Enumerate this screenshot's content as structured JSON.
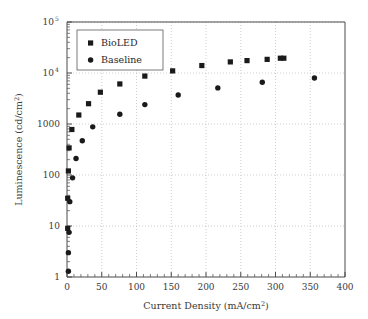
{
  "chart_data": {
    "type": "scatter",
    "title": "",
    "xlabel": "Current Density (mA/cm2)",
    "xlabel_base": "Current Density (mA/cm",
    "xlabel_sup": "2",
    "xlabel_tail": ")",
    "ylabel": "Luminescence (cd/cm2)",
    "ylabel_base": "Luminescence (cd/cm",
    "ylabel_sup": "2",
    "ylabel_tail": ")",
    "xlim": [
      0,
      400
    ],
    "ylim": [
      1,
      100000
    ],
    "yscale": "log",
    "xscale": "linear",
    "grid": true,
    "legend_position": "top-left",
    "xticks": [
      0,
      50,
      100,
      150,
      200,
      250,
      300,
      350,
      400
    ],
    "xtick_labels": [
      "0",
      "50",
      "100",
      "150",
      "200",
      "250",
      "300",
      "350",
      "400"
    ],
    "x_minor_step": 10,
    "yticks": [
      1,
      10,
      100,
      1000,
      10000,
      100000
    ],
    "ytick_labels": [
      "1",
      "10",
      "100",
      "1000",
      "10",
      "10"
    ],
    "ytick_label_sup": [
      "",
      "",
      "",
      "",
      "4",
      "5"
    ],
    "series": [
      {
        "name": "BioLED",
        "marker": "square",
        "color": "#1a1a1a",
        "points": [
          [
            1,
            35
          ],
          [
            1,
            9
          ],
          [
            2,
            120
          ],
          [
            3,
            340
          ],
          [
            7,
            780
          ],
          [
            17,
            1500
          ],
          [
            31,
            2500
          ],
          [
            48,
            4200
          ],
          [
            76,
            6100
          ],
          [
            112,
            8700
          ],
          [
            152,
            11000
          ],
          [
            194,
            14000
          ],
          [
            235,
            16500
          ],
          [
            259,
            17500
          ],
          [
            288,
            18500
          ],
          [
            307,
            19500
          ],
          [
            312,
            19500
          ]
        ]
      },
      {
        "name": "Baseline",
        "marker": "circle",
        "color": "#1a1a1a",
        "points": [
          [
            2,
            1.3
          ],
          [
            2,
            3.0
          ],
          [
            3,
            7.5
          ],
          [
            4,
            30
          ],
          [
            8,
            88
          ],
          [
            13,
            210
          ],
          [
            22,
            470
          ],
          [
            37,
            880
          ],
          [
            76,
            1550
          ],
          [
            112,
            2400
          ],
          [
            160,
            3700
          ],
          [
            217,
            5100
          ],
          [
            281,
            6600
          ],
          [
            356,
            8000
          ]
        ]
      }
    ],
    "legend_entries": [
      {
        "label": "BioLED",
        "marker": "square"
      },
      {
        "label": "Baseline",
        "marker": "circle"
      }
    ]
  },
  "plot_geometry": {
    "left": 67,
    "right": 345,
    "top": 22,
    "bottom": 277
  }
}
